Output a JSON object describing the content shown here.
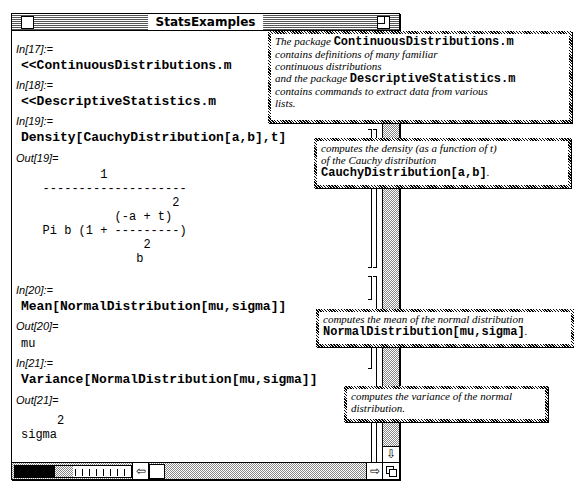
{
  "window": {
    "title": "StatsExamples"
  },
  "cells": [
    {
      "label": "In[17]:=",
      "input": "<<ContinuousDistributions.m"
    },
    {
      "label": "In[18]:=",
      "input": "<<DescriptiveStatistics.m"
    },
    {
      "label": "In[19]:=",
      "input": "Density[CauchyDistribution[a,b],t]"
    },
    {
      "label": "Out[19]=",
      "output": "           1\n   --------------------\n                     2\n             (-a + t)\n   Pi b (1 + ---------)\n                 2\n                b"
    },
    {
      "label": "In[20]:=",
      "input": "Mean[NormalDistribution[mu,sigma]]"
    },
    {
      "label": "Out[20]=",
      "output": "mu"
    },
    {
      "label": "In[21]:=",
      "input": "Variance[NormalDistribution[mu,sigma]]"
    },
    {
      "label": "Out[21]=",
      "output": "     2\nsigma"
    }
  ],
  "notes": [
    {
      "line1_text": "The package ",
      "line1_code": "ContinuousDistributions.m",
      "line2": "contains definitions of many familiar",
      "line3": "continuous distributions",
      "line4_text": "and the package ",
      "line4_code": "DescriptiveStatistics.m",
      "line5": "contains commands to extract data from various",
      "line6": "lists."
    },
    {
      "line1": "computes the density (as a function of t)",
      "line2": "of the Cauchy distribution",
      "line3_code": "CauchyDistribution[a,b]",
      "line3_end": "."
    },
    {
      "line1": "computes the mean of the normal distribution",
      "line2_code": "NormalDistribution[mu,sigma]",
      "line2_end": "."
    },
    {
      "line1": "computes the variance of the normal",
      "line2": "distribution."
    }
  ],
  "scrollbars": {
    "left_arrow": "⇦",
    "right_arrow": "⇨",
    "down_arrow": "⇩"
  }
}
